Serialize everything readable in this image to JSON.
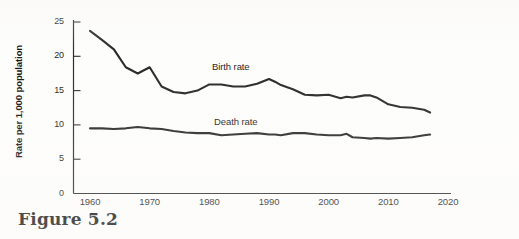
{
  "figure": {
    "caption": "Figure 5.2"
  },
  "chart_data": {
    "type": "line",
    "title": "",
    "xlabel": "",
    "ylabel": "Rate per 1,000 population",
    "xlim": [
      1960,
      2020
    ],
    "ylim": [
      0,
      25
    ],
    "grid": false,
    "legend_position": "inline-labels",
    "xticks": [
      "1960",
      "1970",
      "1980",
      "1990",
      "2000",
      "2010",
      "2020"
    ],
    "xtick_values": [
      1960,
      1970,
      1980,
      1990,
      2000,
      2010,
      2020
    ],
    "yticks": [
      "0",
      "5",
      "10",
      "15",
      "20",
      "25"
    ],
    "ytick_values": [
      0,
      5,
      10,
      15,
      20,
      25
    ],
    "x": [
      1960,
      1962,
      1964,
      1966,
      1968,
      1970,
      1972,
      1974,
      1976,
      1978,
      1980,
      1982,
      1984,
      1986,
      1988,
      1990,
      1991,
      1992,
      1994,
      1996,
      1998,
      2000,
      2002,
      2003,
      2004,
      2006,
      2007,
      2008,
      2010,
      2012,
      2014,
      2016,
      2017
    ],
    "series": [
      {
        "name": "Birth rate",
        "label": "Birth rate",
        "color": "#262626",
        "values": [
          23.7,
          22.4,
          21.0,
          18.4,
          17.5,
          18.4,
          15.6,
          14.8,
          14.6,
          15.0,
          15.9,
          15.9,
          15.6,
          15.6,
          16.0,
          16.7,
          16.3,
          15.8,
          15.2,
          14.4,
          14.3,
          14.4,
          13.9,
          14.1,
          14.0,
          14.3,
          14.3,
          14.0,
          13.0,
          12.6,
          12.5,
          12.2,
          11.8
        ]
      },
      {
        "name": "Death rate",
        "label": "Death rate",
        "color": "#262626",
        "values": [
          9.5,
          9.5,
          9.4,
          9.5,
          9.7,
          9.5,
          9.4,
          9.1,
          8.9,
          8.8,
          8.8,
          8.5,
          8.6,
          8.7,
          8.8,
          8.6,
          8.6,
          8.5,
          8.8,
          8.8,
          8.6,
          8.5,
          8.5,
          8.7,
          8.2,
          8.1,
          8.0,
          8.1,
          8.0,
          8.1,
          8.2,
          8.5,
          8.6
        ]
      }
    ],
    "annotations": [
      {
        "text": "Birth rate",
        "x": 1981,
        "y": 17.3
      },
      {
        "text": "Death rate",
        "x": 1981,
        "y": 11.0
      }
    ]
  }
}
